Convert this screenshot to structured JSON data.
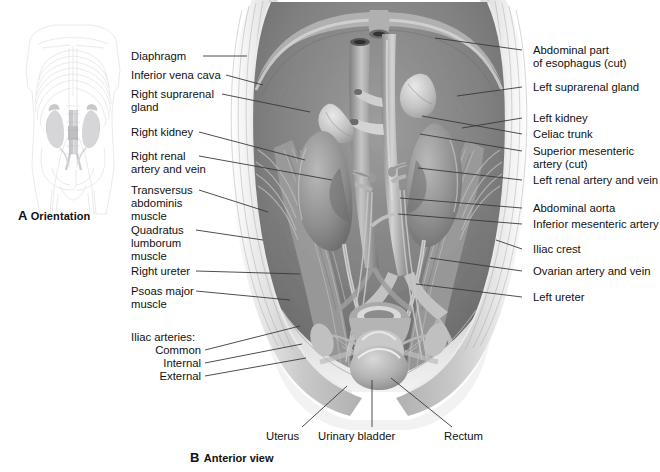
{
  "figure": {
    "panel_a": {
      "letter": "A",
      "title": "Orientation",
      "icon": "body-skeleton-orientation-icon"
    },
    "panel_b": {
      "letter": "B",
      "title": "Anterior view",
      "icon": "posterior-abdominal-wall-illustration"
    },
    "bottom_caption_partial": ""
  },
  "labels_left": [
    {
      "id": "diaphragm",
      "text": "Diaphragm",
      "x": 131,
      "y": 50,
      "w": 92,
      "lx1": 203,
      "ly1": 56,
      "lx2": 247,
      "ly2": 56
    },
    {
      "id": "inferior-vena-cava",
      "text": "Inferior vena cava",
      "x": 131,
      "y": 69,
      "w": 100,
      "lx1": 226,
      "ly1": 75,
      "lx2": 263,
      "ly2": 85
    },
    {
      "id": "right-suprarenal-gland",
      "text": "Right suprarenal\ngland",
      "x": 131,
      "y": 88,
      "w": 100,
      "lx1": 222,
      "ly1": 94,
      "lx2": 310,
      "ly2": 112
    },
    {
      "id": "right-kidney",
      "text": "Right kidney",
      "x": 131,
      "y": 126,
      "w": 100,
      "lx1": 199,
      "ly1": 132,
      "lx2": 305,
      "ly2": 160
    },
    {
      "id": "right-renal-vessels",
      "text": "Right renal\nartery and vein",
      "x": 131,
      "y": 150,
      "w": 100,
      "lx1": 199,
      "ly1": 156,
      "lx2": 332,
      "ly2": 180
    },
    {
      "id": "transversus-abdominis",
      "text": "Transversus\nabdominis\nmuscle",
      "x": 131,
      "y": 184,
      "w": 100,
      "lx1": 199,
      "ly1": 190,
      "lx2": 268,
      "ly2": 212
    },
    {
      "id": "quadratus-lumborum",
      "text": "Quadratus\nlumborum\nmuscle",
      "x": 131,
      "y": 224,
      "w": 100,
      "lx1": 196,
      "ly1": 230,
      "lx2": 263,
      "ly2": 240
    },
    {
      "id": "right-ureter",
      "text": "Right ureter",
      "x": 131,
      "y": 265,
      "w": 100,
      "lx1": 196,
      "ly1": 271,
      "lx2": 300,
      "ly2": 274
    },
    {
      "id": "psoas-major",
      "text": "Psoas major\nmuscle",
      "x": 131,
      "y": 285,
      "w": 100,
      "lx1": 196,
      "ly1": 291,
      "lx2": 290,
      "ly2": 300
    }
  ],
  "labels_left_group": {
    "heading": {
      "id": "iliac-arteries-heading",
      "text": "Iliac arteries:",
      "x": 131,
      "y": 331
    },
    "items": [
      {
        "id": "iliac-common",
        "text": "Common",
        "x": 131,
        "y": 344,
        "w": 70,
        "lx1": 205,
        "ly1": 350,
        "lx2": 300,
        "ly2": 326
      },
      {
        "id": "iliac-internal",
        "text": "Internal",
        "x": 131,
        "y": 357,
        "w": 70,
        "lx1": 205,
        "ly1": 363,
        "lx2": 302,
        "ly2": 344
      },
      {
        "id": "iliac-external",
        "text": "External",
        "x": 131,
        "y": 370,
        "w": 70,
        "lx1": 205,
        "ly1": 376,
        "lx2": 306,
        "ly2": 358
      }
    ]
  },
  "labels_right": [
    {
      "id": "abdominal-esophagus",
      "text": "Abdominal part\nof esophagus (cut)",
      "x": 533,
      "y": 44,
      "lx1": 522,
      "ly1": 50,
      "lx2": 435,
      "ly2": 38
    },
    {
      "id": "left-suprarenal-gland",
      "text": "Left suprarenal gland",
      "x": 533,
      "y": 81,
      "lx1": 522,
      "ly1": 87,
      "lx2": 457,
      "ly2": 96
    },
    {
      "id": "left-kidney",
      "text": "Left kidney",
      "x": 533,
      "y": 112,
      "lx1": 522,
      "ly1": 118,
      "lx2": 462,
      "ly2": 128
    },
    {
      "id": "celiac-trunk",
      "text": "Celiac trunk",
      "x": 533,
      "y": 128,
      "lx1": 522,
      "ly1": 134,
      "lx2": 422,
      "ly2": 116
    },
    {
      "id": "superior-mesenteric-artery",
      "text": "Superior mesenteric\nartery (cut)",
      "x": 533,
      "y": 145,
      "lx1": 522,
      "ly1": 151,
      "lx2": 420,
      "ly2": 134
    },
    {
      "id": "left-renal-vessels",
      "text": "Left renal artery and vein",
      "x": 533,
      "y": 174,
      "lx1": 522,
      "ly1": 180,
      "lx2": 418,
      "ly2": 168
    },
    {
      "id": "abdominal-aorta",
      "text": "Abdominal aorta",
      "x": 533,
      "y": 202,
      "lx1": 522,
      "ly1": 208,
      "lx2": 400,
      "ly2": 198
    },
    {
      "id": "inferior-mesenteric-artery",
      "text": "Inferior mesenteric artery",
      "x": 533,
      "y": 218,
      "lx1": 522,
      "ly1": 224,
      "lx2": 398,
      "ly2": 214
    },
    {
      "id": "iliac-crest",
      "text": "Iliac crest",
      "x": 533,
      "y": 243,
      "lx1": 522,
      "ly1": 249,
      "lx2": 496,
      "ly2": 240
    },
    {
      "id": "ovarian-vessels",
      "text": "Ovarian artery and vein",
      "x": 533,
      "y": 265,
      "lx1": 522,
      "ly1": 271,
      "lx2": 430,
      "ly2": 258
    },
    {
      "id": "left-ureter",
      "text": "Left ureter",
      "x": 533,
      "y": 291,
      "lx1": 522,
      "ly1": 297,
      "lx2": 416,
      "ly2": 284
    }
  ],
  "labels_bottom": [
    {
      "id": "uterus",
      "text": "Uterus",
      "x": 266,
      "y": 430,
      "lx1": 302,
      "ly1": 427,
      "lx2": 347,
      "ly2": 386
    },
    {
      "id": "urinary-bladder",
      "text": "Urinary bladder",
      "x": 318,
      "y": 430,
      "lx1": 372,
      "ly1": 427,
      "lx2": 372,
      "ly2": 380
    },
    {
      "id": "rectum",
      "text": "Rectum",
      "x": 444,
      "y": 430,
      "lx1": 452,
      "ly1": 427,
      "lx2": 391,
      "ly2": 378
    }
  ],
  "colors": {
    "text": "#111111",
    "leader": "#3a3a3a",
    "illustration_light": "#efefef",
    "illustration_mid": "#9a9a9a",
    "illustration_dark": "#5a5a5a",
    "orientation_outline": "#e3e3e6",
    "orientation_organ": "#b9b9bd"
  }
}
